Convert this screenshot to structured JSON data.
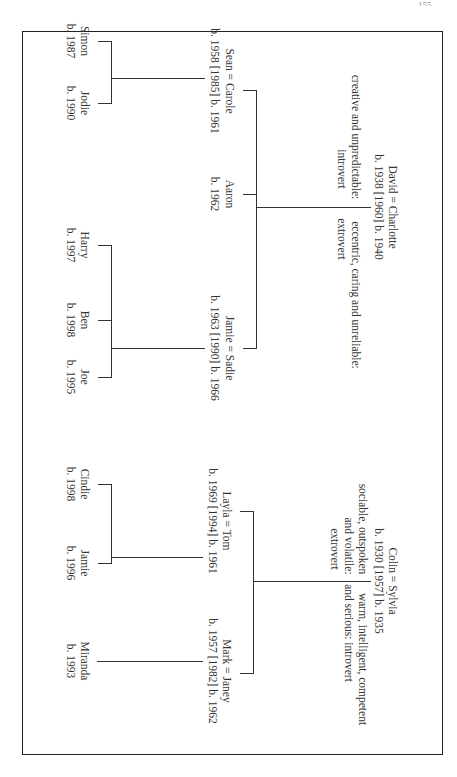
{
  "page": {
    "orientation": "rotated-90-clockwise",
    "page_number": "155"
  },
  "families": [
    {
      "name": "left-family",
      "parents": {
        "couple": "David = Charlotte",
        "dates": "b. 1938  [1960]  b. 1940",
        "traits_left": [
          "creative and unpredictable:",
          "introvert"
        ],
        "traits_right": [
          "eccentric, caring and unreliable:",
          "extrovert"
        ]
      },
      "children": [
        {
          "label": "Sean = Carole",
          "dates": "b. 1958  [1985]  b. 1961"
        },
        {
          "label": "Aaron",
          "dates": "b. 1962"
        },
        {
          "label": "Jamie = Sadie",
          "dates": "b. 1963  [1990]  b. 1966"
        }
      ],
      "grandchildren": [
        {
          "parent": "Sean = Carole",
          "children": [
            {
              "label": "Simon",
              "dates": "b. 1987"
            },
            {
              "label": "Jodie",
              "dates": "b. 1990"
            }
          ]
        },
        {
          "parent": "Jamie = Sadie",
          "children": [
            {
              "label": "Harry",
              "dates": "b. 1997"
            },
            {
              "label": "Ben",
              "dates": "b. 1998"
            },
            {
              "label": "Joe",
              "dates": "b. 1995"
            }
          ]
        }
      ]
    },
    {
      "name": "right-family",
      "parents": {
        "couple": "Colin = Sylvia",
        "dates": "b. 1930  [1957]  b. 1935",
        "traits_left": [
          "sociable, outspoken",
          "and volatile:",
          "extrovert"
        ],
        "traits_right": [
          "warm, intelligent, competent",
          "and serious: introvert"
        ]
      },
      "children": [
        {
          "label": "Layla = Tom",
          "dates": "b. 1969  [1994]  b. 1961"
        },
        {
          "label": "Mark = Janey",
          "dates": "b. 1957  [1982]  b. 1962"
        }
      ],
      "grandchildren": [
        {
          "parent": "Layla = Tom",
          "children": [
            {
              "label": "Cindie",
              "dates": "b. 1998"
            },
            {
              "label": "Jamie",
              "dates": "b. 1996"
            }
          ]
        },
        {
          "parent": "Mark = Janey",
          "children": [
            {
              "label": "Miranda",
              "dates": "b. 1993"
            }
          ]
        }
      ]
    }
  ],
  "colors": {
    "line": "#333333",
    "text": "#333333",
    "frame": "#222222",
    "background": "#ffffff"
  }
}
